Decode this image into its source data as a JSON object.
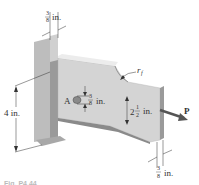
{
  "figure": {
    "caption": "Fig. P4.44",
    "labels": {
      "top_thickness": {
        "num": "3",
        "den": "8",
        "unit": "in."
      },
      "height": "4 in.",
      "hole_point": "A",
      "hole_dia": {
        "num": "3",
        "den": "8",
        "unit": "in."
      },
      "fillet": "r",
      "fillet_sub": "f",
      "bar_width": {
        "whole": "2",
        "num": "1",
        "den": "2",
        "unit": "in."
      },
      "load": "P",
      "bar_thickness": {
        "num": "3",
        "den": "8",
        "unit": "in."
      }
    },
    "colors": {
      "wall_face": "#c9c9c9",
      "wall_dark": "#9a9a9a",
      "plate_face": "#d4d4d4",
      "plate_edge": "#a8a8a8",
      "arrow": "#555555",
      "line": "#333333"
    }
  }
}
